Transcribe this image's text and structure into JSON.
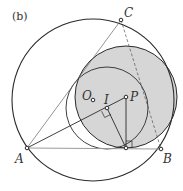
{
  "figure": {
    "tag": "(b)",
    "colors": {
      "stroke": "#2a2a2a",
      "shade": "#d6d6d6",
      "thin": "#666666",
      "baseline": "#9a9a9a"
    },
    "points": {
      "A": {
        "label": "A",
        "x": 27,
        "y": 148
      },
      "B": {
        "label": "B",
        "x": 161,
        "y": 149
      },
      "C": {
        "label": "C",
        "x": 121,
        "y": 20
      },
      "O": {
        "label": "O",
        "x": 93,
        "y": 100
      },
      "I": {
        "label": "I",
        "x": 107,
        "y": 108
      },
      "P": {
        "label": "P",
        "x": 126,
        "y": 97
      },
      "T": {
        "label": "",
        "x": 126,
        "y": 148
      }
    },
    "circles": {
      "circumcircle": {
        "cx": 93,
        "cy": 100,
        "r": 81
      },
      "shaded": {
        "cx": 126,
        "cy": 97,
        "r": 51
      },
      "inner": {
        "cx": 107,
        "cy": 108,
        "r": 41
      }
    }
  }
}
